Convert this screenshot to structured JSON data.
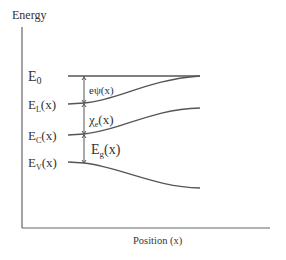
{
  "diagram": {
    "y_axis_label": "Energy",
    "x_axis_label": "Position (x)",
    "levels": [
      {
        "main": "E",
        "sub": "0",
        "suffix": ""
      },
      {
        "main": "E",
        "sub": "L",
        "suffix": "(x)"
      },
      {
        "main": "E",
        "sub": "C",
        "suffix": "(x)"
      },
      {
        "main": "E",
        "sub": "V",
        "suffix": "(x)"
      }
    ],
    "gaps": [
      {
        "main": "eψ",
        "sub": "",
        "suffix": "(x)"
      },
      {
        "main": "χ",
        "sub": "e",
        "suffix": "(x)"
      },
      {
        "main": "E",
        "sub": "g",
        "suffix": "(x)"
      }
    ],
    "colors": {
      "line": "#555555",
      "text": "#333333"
    }
  }
}
